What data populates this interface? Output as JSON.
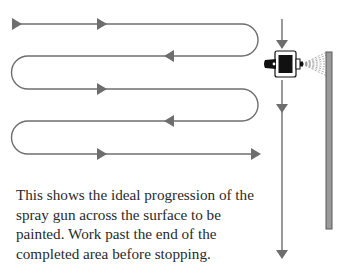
{
  "diagram": {
    "path_color": "#6e6e6e",
    "panel_color": "#9a9a9a",
    "panel_border": "#5a5a5a",
    "gun_color": "#111111",
    "spray_color": "#8a8a8a",
    "passes": [
      {
        "y": 24,
        "direction": "right"
      },
      {
        "y": 56,
        "direction": "left"
      },
      {
        "y": 89,
        "direction": "right"
      },
      {
        "y": 121,
        "direction": "left"
      },
      {
        "y": 154,
        "direction": "right"
      }
    ],
    "elements": [
      "serpentine-spray-path",
      "spray-gun",
      "spray-cone",
      "painted-surface-panel",
      "vertical-travel-arrow"
    ]
  },
  "caption": {
    "lines": [
      "This shows the ideal progression of the",
      "spray gun across the surface to be",
      "painted. Work past the end of the",
      "completed area before stopping."
    ]
  }
}
